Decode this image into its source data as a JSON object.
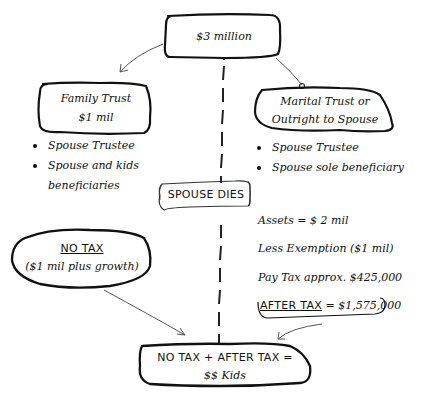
{
  "diagram": {
    "root": {
      "label": "$3 million"
    },
    "family_trust": {
      "title": "Family Trust",
      "amount": "$1 mil",
      "bullets": [
        "Spouse Trustee",
        "Spouse and kids",
        "beneficiaries"
      ]
    },
    "marital_trust": {
      "title_line1": "Marital Trust or",
      "title_line2": "Outright to Spouse",
      "bullets": [
        "Spouse Trustee",
        "Spouse sole beneficiary"
      ]
    },
    "event": {
      "label": "SPOUSE DIES"
    },
    "no_tax": {
      "title": "NO TAX",
      "detail": "($1 mil plus growth)"
    },
    "calculation": {
      "assets": "Assets = $ 2 mil",
      "exemption": "Less Exemption ($1 mil)",
      "tax": "Pay Tax approx. $425,000",
      "after_tax_label": "AFTER TAX",
      "after_tax_value": " = $1,575,000"
    },
    "result": {
      "line1": "NO TAX + AFTER TAX =",
      "line2": "$$ Kids"
    },
    "colors": {
      "ink": "#111111",
      "arrow": "#555555",
      "background": "#ffffff"
    }
  }
}
